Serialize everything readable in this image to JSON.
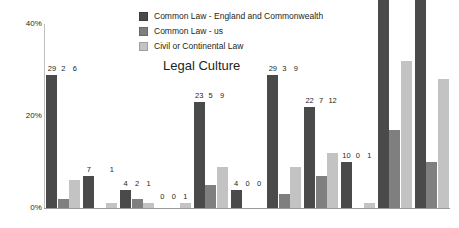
{
  "chart_data": {
    "type": "bar",
    "title": "Legal Culture",
    "xlabel": "",
    "ylabel": "",
    "ylim": [
      0,
      40
    ],
    "yticks": [
      "0%",
      "20%",
      "40%"
    ],
    "ytick_values": [
      0,
      20,
      40
    ],
    "grid": false,
    "legend_position": "top-center",
    "categories": [
      "1",
      "2",
      "3",
      "4",
      "5",
      "6",
      "7",
      "8",
      "9",
      "10",
      "11"
    ],
    "series": [
      {
        "name": "Common Law - England and Commonwealth",
        "color": "#4a4a4a",
        "values": [
          29,
          7,
          4,
          0,
          23,
          4,
          29,
          22,
          10,
          90,
          71
        ]
      },
      {
        "name": "Common Law - us",
        "color": "#7f7f7f",
        "values": [
          2,
          0,
          2,
          0,
          5,
          0,
          3,
          7,
          0,
          17,
          10
        ]
      },
      {
        "name": "Civil or Continental Law",
        "color": "#c3c3c3",
        "values": [
          6,
          1,
          1,
          1,
          9,
          0,
          9,
          12,
          1,
          32,
          28
        ]
      }
    ],
    "group_labels": [
      [
        "29",
        "2",
        "6"
      ],
      [
        "7",
        "",
        "1"
      ],
      [
        "4",
        "2",
        "1"
      ],
      [
        "0",
        "0",
        "1"
      ],
      [
        "23",
        "5",
        "9"
      ],
      [
        "4",
        "0",
        "0"
      ],
      [
        "29",
        "3",
        "9"
      ],
      [
        "22",
        "7",
        "12"
      ],
      [
        "10",
        "0",
        "1"
      ],
      [
        "90",
        "17",
        "32"
      ],
      [
        "71",
        "10",
        "28"
      ]
    ]
  },
  "legend": {
    "items": [
      {
        "label": "Common Law - England and Commonwealth",
        "color": "#4a4a4a"
      },
      {
        "label": "Common Law - us",
        "color": "#7f7f7f"
      },
      {
        "label": "Civil or Continental Law",
        "color": "#c3c3c3"
      }
    ]
  },
  "axis": {
    "y_ticks": [
      "40%",
      "20%",
      "0%"
    ]
  }
}
